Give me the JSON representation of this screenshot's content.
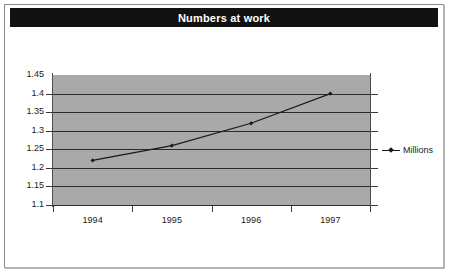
{
  "frame": {
    "border_color": "#8a8a8a",
    "background": "#ffffff"
  },
  "title_bar": {
    "text": "Numbers at work",
    "background": "#111111",
    "text_color": "#ffffff"
  },
  "legend": {
    "position": "right",
    "entries": [
      {
        "label": "Millions",
        "marker": "diamond-marker",
        "color": "#1a1a1a"
      }
    ]
  },
  "chart_data": {
    "type": "line",
    "title": "Numbers at work",
    "xlabel": "",
    "ylabel": "",
    "categories": [
      "1994",
      "1995",
      "1996",
      "1997"
    ],
    "series": [
      {
        "name": "Millions",
        "values": [
          1.22,
          1.26,
          1.32,
          1.4
        ]
      }
    ],
    "ylim": [
      1.1,
      1.45
    ],
    "yticks": [
      1.45,
      1.4,
      1.35,
      1.3,
      1.25,
      1.2,
      1.15,
      1.1
    ],
    "ytick_labels": [
      "1.45",
      "1.4",
      "1.35",
      "1.3",
      "1.25",
      "1.2",
      "1.15",
      "1.1"
    ],
    "grid": true,
    "grid_orientation": "horizontal",
    "plot_background": "#a9a9a9",
    "line_color": "#1a1a1a",
    "marker": "diamond",
    "legend_position": "right"
  }
}
